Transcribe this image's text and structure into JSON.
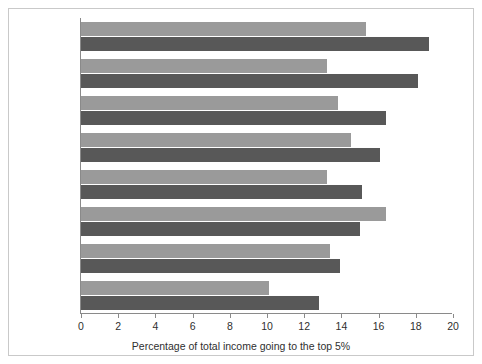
{
  "chart_data": {
    "type": "bar",
    "orientation": "horizontal",
    "title": "",
    "xlabel": "Percentage of total income going to the top 5%",
    "ylabel": "",
    "xlim": [
      0,
      20
    ],
    "xticks": [
      0,
      2,
      4,
      6,
      8,
      10,
      12,
      14,
      16,
      18,
      20
    ],
    "grid": false,
    "legend_position": "right-inside",
    "categories": [
      "USA",
      "UK",
      "Australia",
      "Canada",
      "Germany",
      "Spain",
      "Netherlands",
      "Sweden"
    ],
    "series": [
      {
        "name": "early 1980s",
        "color": "#9a9a9a",
        "values": [
          15.3,
          13.2,
          13.8,
          14.5,
          13.2,
          16.4,
          13.4,
          10.1
        ]
      },
      {
        "name": "2010",
        "color": "#585858",
        "values": [
          18.7,
          18.1,
          16.4,
          16.1,
          15.1,
          15.0,
          13.9,
          12.8
        ]
      }
    ]
  },
  "axis": {
    "tick_labels": [
      "0",
      "2",
      "4",
      "6",
      "8",
      "10",
      "12",
      "14",
      "16",
      "18",
      "20"
    ],
    "x_axis_title": "Percentage of total income going to the top 5%"
  },
  "legend": {
    "items": [
      {
        "label": "early 1980s",
        "color": "#9a9a9a"
      },
      {
        "label": "2010",
        "color": "#585858"
      }
    ]
  },
  "colors": {
    "series_early_1980s": "#9a9a9a",
    "series_2010": "#585858",
    "axis": "#8a8a8a",
    "text": "#2f2f2f",
    "background": "#ffffff"
  }
}
